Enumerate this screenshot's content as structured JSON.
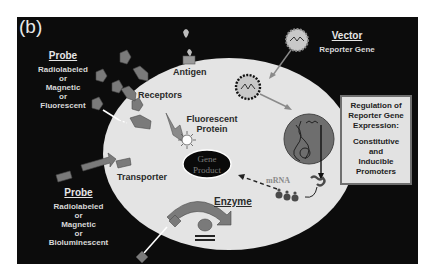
{
  "panel": {
    "letter": "(b)",
    "background_color": "#0c0c0c",
    "cell_color": "#e4e4e4"
  },
  "labels": {
    "probe_top": {
      "title": "Probe",
      "lines": [
        "Radiolabeled",
        "or",
        "Magnetic",
        "or",
        "Fluorescent"
      ]
    },
    "probe_bottom": {
      "title": "Probe",
      "lines": [
        "Radiolabeled",
        "or",
        "Magnetic",
        "or",
        "Bioluminescent"
      ]
    },
    "vector": {
      "title": "Vector",
      "subtitle": "Reporter Gene"
    },
    "antigen": "Antigen",
    "receptors": "Receptors",
    "fluorescent_protein": [
      "Fluorescent",
      "Protein"
    ],
    "gene_product": [
      "Gene",
      "Product"
    ],
    "transporter": "Transporter",
    "enzyme": "Enzyme",
    "mrna": "mRNA"
  },
  "regulation_box": {
    "lines": [
      "Regulation of",
      "Reporter Gene",
      "Expression:",
      "",
      "Constitutive",
      "and",
      "Inducible",
      "Promoters"
    ]
  },
  "icons": {
    "probe": "pentagon-probe-icon",
    "vector": "starburst-vector-icon",
    "nucleus": "nucleus-dna-icon",
    "fluor": "glowing-star-icon",
    "enzyme": "curved-arrow-icon"
  }
}
